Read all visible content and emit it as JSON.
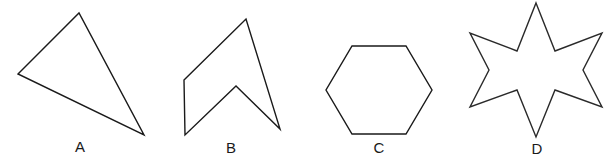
{
  "figure": {
    "width": 616,
    "height": 161,
    "background_color": "#ffffff",
    "stroke_color": "#1a1a1a",
    "label_color": "#1a1a1a",
    "shapes": [
      {
        "id": "shape-a",
        "label": "A",
        "kind": "triangle",
        "sides": 3,
        "convex": true,
        "label_x": 80,
        "label_y": 146,
        "points": "18,74 79,13 144,135"
      },
      {
        "id": "shape-b",
        "label": "B",
        "kind": "concave-pentagon",
        "sides": 5,
        "convex": false,
        "label_x": 231,
        "label_y": 147,
        "points": "184,80 246,19 280,129 236,86 185,135"
      },
      {
        "id": "shape-c",
        "label": "C",
        "kind": "hexagon",
        "sides": 6,
        "convex": true,
        "label_x": 379,
        "label_y": 147,
        "points": "352,46 406,46 432,90 406,134 352,134 326,90"
      },
      {
        "id": "shape-d",
        "label": "D",
        "kind": "eight-pointed-star",
        "sides": 16,
        "convex": false,
        "label_x": 537,
        "label_y": 148,
        "points": "536,3 555,51 602,33 583,70 602,107 555,90 536,137 517,90 470,107 489,70 470,33 517,51"
      }
    ]
  }
}
